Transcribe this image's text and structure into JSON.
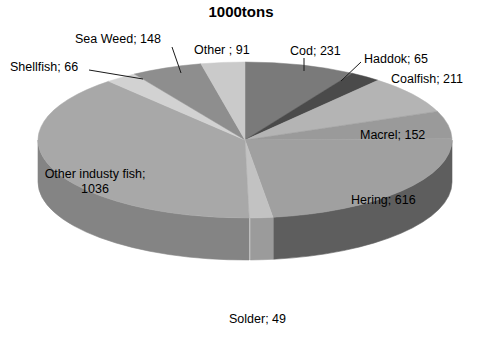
{
  "chart_data": {
    "type": "pie",
    "title": "1000tons",
    "xlabel": "",
    "ylabel": "",
    "legend": "none",
    "grid": false,
    "label_format": "name; value",
    "total": 2665,
    "categories": [
      "Cod",
      "Haddok",
      "Coalfish",
      "Macrel",
      "Hering",
      "Solder",
      "Other industy fish",
      "Shellfish",
      "Sea Weed",
      "Other "
    ],
    "values": [
      231,
      65,
      211,
      152,
      616,
      49,
      1036,
      66,
      148,
      91
    ],
    "slices": [
      {
        "name": "Cod",
        "value": 231,
        "label": "Cod; 231",
        "color": "#7a7a7a",
        "side_color": "#5a5a5a",
        "percent": 8.7
      },
      {
        "name": "Haddok",
        "value": 65,
        "label": "Haddok; 65",
        "color": "#4a4a4a",
        "side_color": "#353535",
        "percent": 2.4
      },
      {
        "name": "Coalfish",
        "value": 211,
        "label": "Coalfish; 211",
        "color": "#b4b4b4",
        "side_color": "#8c8c8c",
        "percent": 7.9
      },
      {
        "name": "Macrel",
        "value": 152,
        "label": "Macrel; 152",
        "color": "#9a9a9a",
        "side_color": "#767676",
        "percent": 5.7
      },
      {
        "name": "Hering",
        "value": 616,
        "label": "Hering; 616",
        "color": "#a0a0a0",
        "side_color": "#5e5e5e",
        "percent": 23.1
      },
      {
        "name": "Solder",
        "value": 49,
        "label": "Solder; 49",
        "color": "#c2c2c2",
        "side_color": "#9b9b9b",
        "percent": 1.8
      },
      {
        "name": "Other industy fish",
        "value": 1036,
        "label": "Other industy fish; 1036",
        "color": "#a8a8a8",
        "side_color": "#848484",
        "percent": 38.9
      },
      {
        "name": "Shellfish",
        "value": 66,
        "label": "Shellfish; 66",
        "color": "#d2d2d2",
        "side_color": "#a6a6a6",
        "percent": 2.5
      },
      {
        "name": "Sea Weed",
        "value": 148,
        "label": "Sea Weed; 148",
        "color": "#8e8e8e",
        "side_color": "#6e6e6e",
        "percent": 5.6
      },
      {
        "name": "Other ",
        "value": 91,
        "label": "Other ; 91",
        "color": "#cacaca",
        "side_color": "#9e9e9e",
        "percent": 3.4
      }
    ],
    "labels": [
      {
        "id": "cod",
        "text": "Cod; 231",
        "x": 290,
        "y": 44,
        "align": "left",
        "leader": [
          [
            304,
            58
          ],
          [
            304,
            71
          ]
        ]
      },
      {
        "id": "haddok",
        "text": "Haddok; 65",
        "x": 364,
        "y": 52,
        "align": "left",
        "leader": [
          [
            361,
            62
          ],
          [
            341,
            81
          ]
        ]
      },
      {
        "id": "coalfish",
        "text": "Coalfish; 211",
        "x": 391,
        "y": 72,
        "align": "left",
        "leader": []
      },
      {
        "id": "macrel",
        "text": "Macrel; 152",
        "x": 360,
        "y": 128,
        "align": "left",
        "leader": []
      },
      {
        "id": "hering",
        "text": "Hering; 616",
        "x": 351,
        "y": 193,
        "align": "left",
        "leader": []
      },
      {
        "id": "solder",
        "text": "Solder; 49",
        "x": 229,
        "y": 312,
        "align": "left",
        "leader": []
      },
      {
        "id": "otherfish",
        "text": "Other industy fish; 1036",
        "x": 40,
        "y": 167,
        "align": "left",
        "leader": []
      },
      {
        "id": "shellfish",
        "text": "Shellfish; 66",
        "x": 10,
        "y": 60,
        "align": "left",
        "leader": [
          [
            89,
            70
          ],
          [
            143,
            79
          ]
        ]
      },
      {
        "id": "seaweed",
        "text": "Sea Weed; 148",
        "x": 75,
        "y": 32,
        "align": "left",
        "leader": [
          [
            172,
            47
          ],
          [
            181,
            73
          ]
        ]
      },
      {
        "id": "other",
        "text": "Other ; 91",
        "x": 194,
        "y": 43,
        "align": "left",
        "leader": []
      }
    ]
  },
  "geometry": {
    "cx": 245,
    "cy": 140,
    "rx": 207,
    "ry": 78,
    "depth": 42,
    "start_angle_deg": -90
  },
  "colors": {
    "background": "#ffffff",
    "text": "#000000",
    "leader_line": "#1a1a1a"
  }
}
